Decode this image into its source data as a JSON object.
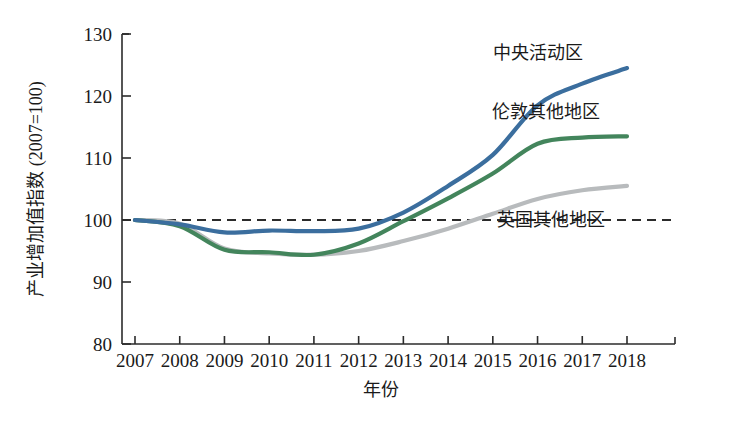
{
  "chart_data": {
    "type": "line",
    "title": "",
    "xlabel": "年份",
    "ylabel": "产业增加值指数 (2007=100)",
    "xlim": [
      2007,
      2018
    ],
    "ylim": [
      80,
      130
    ],
    "grid": false,
    "legend_position": "inline-right",
    "x_ticks": [
      "2007",
      "2008",
      "2009",
      "2010",
      "2011",
      "2012",
      "2013",
      "2014",
      "2015",
      "2016",
      "2017",
      "2018"
    ],
    "y_ticks": [
      "80",
      "90",
      "100",
      "110",
      "120",
      "130"
    ],
    "x": [
      2007,
      2008,
      2009,
      2010,
      2011,
      2012,
      2013,
      2014,
      2015,
      2016,
      2017,
      2018
    ],
    "reference_line": {
      "value": 100,
      "style": "dashed",
      "color": "#2b2b2b"
    },
    "series": [
      {
        "name": "中央活动区",
        "color": "#3b6e9e",
        "label_x": 2016.0,
        "label_y": 127.0,
        "values": [
          100.0,
          99.3,
          98.0,
          98.3,
          98.2,
          98.6,
          101.2,
          105.5,
          110.5,
          118.5,
          122.0,
          124.5
        ]
      },
      {
        "name": "伦敦其他地区",
        "color": "#43855c",
        "label_x": 2016.2,
        "label_y": 117.5,
        "values": [
          100.0,
          99.0,
          95.2,
          94.8,
          94.4,
          96.2,
          99.8,
          103.5,
          107.5,
          112.3,
          113.3,
          113.5
        ]
      },
      {
        "name": "英国其他地区",
        "color": "#b8bbbd",
        "label_x": 2016.3,
        "label_y": 100.0,
        "values": [
          100.0,
          99.4,
          95.4,
          94.6,
          94.4,
          95.0,
          96.6,
          98.6,
          101.0,
          103.4,
          104.8,
          105.5
        ]
      }
    ]
  }
}
